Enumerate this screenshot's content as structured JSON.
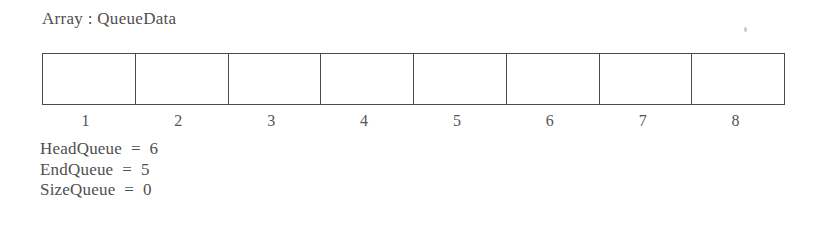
{
  "diagram": {
    "title": "Array : QueueData",
    "array": {
      "name": "QueueData",
      "cells": [
        {
          "index": "1",
          "value": ""
        },
        {
          "index": "2",
          "value": ""
        },
        {
          "index": "3",
          "value": ""
        },
        {
          "index": "4",
          "value": ""
        },
        {
          "index": "5",
          "value": ""
        },
        {
          "index": "6",
          "value": ""
        },
        {
          "index": "7",
          "value": ""
        },
        {
          "index": "8",
          "value": ""
        }
      ]
    },
    "variables": [
      {
        "line": "HeadQueue  =  6",
        "name": "HeadQueue",
        "value": "6"
      },
      {
        "line": "EndQueue  =  5",
        "name": "EndQueue",
        "value": "5"
      },
      {
        "line": "SizeQueue  =  0",
        "name": "SizeQueue",
        "value": "0"
      }
    ],
    "colors": {
      "background": "#ffffff",
      "border": "#4b4b4b",
      "text": "#4f4f4f"
    }
  }
}
